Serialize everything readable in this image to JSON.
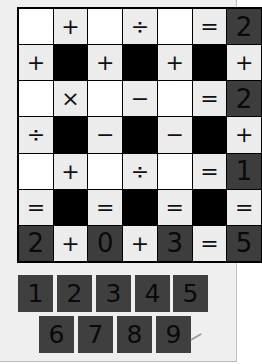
{
  "puzzle": {
    "grid": [
      [
        {
          "t": "empty",
          "v": ""
        },
        {
          "t": "op",
          "v": "+"
        },
        {
          "t": "empty",
          "v": ""
        },
        {
          "t": "op",
          "v": "÷"
        },
        {
          "t": "empty",
          "v": ""
        },
        {
          "t": "op",
          "v": "="
        },
        {
          "t": "num",
          "v": "2"
        }
      ],
      [
        {
          "t": "op",
          "v": "+"
        },
        {
          "t": "block",
          "v": ""
        },
        {
          "t": "op",
          "v": "+"
        },
        {
          "t": "block",
          "v": ""
        },
        {
          "t": "op",
          "v": "+"
        },
        {
          "t": "block",
          "v": ""
        },
        {
          "t": "op",
          "v": "+"
        }
      ],
      [
        {
          "t": "empty",
          "v": ""
        },
        {
          "t": "op",
          "v": "×"
        },
        {
          "t": "empty",
          "v": ""
        },
        {
          "t": "op",
          "v": "−"
        },
        {
          "t": "empty",
          "v": ""
        },
        {
          "t": "op",
          "v": "="
        },
        {
          "t": "num",
          "v": "2"
        }
      ],
      [
        {
          "t": "op",
          "v": "÷"
        },
        {
          "t": "block",
          "v": ""
        },
        {
          "t": "op",
          "v": "−"
        },
        {
          "t": "block",
          "v": ""
        },
        {
          "t": "op",
          "v": "−"
        },
        {
          "t": "block",
          "v": ""
        },
        {
          "t": "op",
          "v": "+"
        }
      ],
      [
        {
          "t": "empty",
          "v": ""
        },
        {
          "t": "op",
          "v": "+"
        },
        {
          "t": "empty",
          "v": ""
        },
        {
          "t": "op",
          "v": "÷"
        },
        {
          "t": "empty",
          "v": ""
        },
        {
          "t": "op",
          "v": "="
        },
        {
          "t": "num",
          "v": "1"
        }
      ],
      [
        {
          "t": "op",
          "v": "="
        },
        {
          "t": "block",
          "v": ""
        },
        {
          "t": "op",
          "v": "="
        },
        {
          "t": "block",
          "v": ""
        },
        {
          "t": "op",
          "v": "="
        },
        {
          "t": "block",
          "v": ""
        },
        {
          "t": "op",
          "v": "="
        }
      ],
      [
        {
          "t": "num",
          "v": "2"
        },
        {
          "t": "op",
          "v": "+"
        },
        {
          "t": "num",
          "v": "0"
        },
        {
          "t": "op",
          "v": "+"
        },
        {
          "t": "num",
          "v": "3"
        },
        {
          "t": "op",
          "v": "="
        },
        {
          "t": "num",
          "v": "5"
        }
      ]
    ],
    "tiles": [
      {
        "label": "1",
        "x": 0,
        "y": 0
      },
      {
        "label": "2",
        "x": 39,
        "y": 0
      },
      {
        "label": "3",
        "x": 78,
        "y": 0
      },
      {
        "label": "4",
        "x": 117,
        "y": 0
      },
      {
        "label": "5",
        "x": 155,
        "y": 0
      },
      {
        "label": "6",
        "x": 21,
        "y": 41
      },
      {
        "label": "7",
        "x": 60,
        "y": 41
      },
      {
        "label": "8",
        "x": 99,
        "y": 41
      },
      {
        "label": "9",
        "x": 138,
        "y": 41
      }
    ]
  }
}
